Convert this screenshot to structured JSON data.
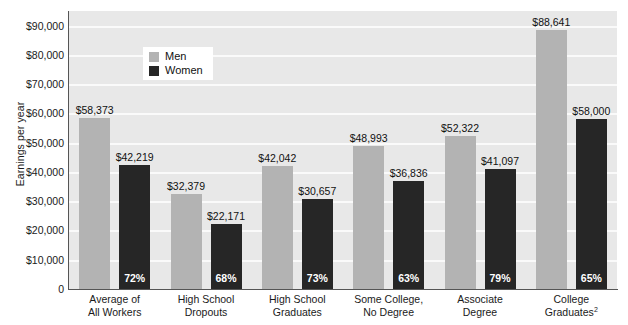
{
  "chart_data": {
    "type": "bar",
    "title": "",
    "xlabel": "",
    "ylabel": "Earnings per year",
    "ylim": [
      0,
      95000
    ],
    "grid": true,
    "legend_position": "top-left-inside",
    "categories": [
      "Average of All Workers",
      "High School Dropouts",
      "High School Graduates",
      "Some College, No Degree",
      "Associate Degree",
      "College Graduates"
    ],
    "category_lines": [
      [
        "Average of",
        "All Workers"
      ],
      [
        "High School",
        "Dropouts"
      ],
      [
        "High School",
        "Graduates"
      ],
      [
        "Some College,",
        "No Degree"
      ],
      [
        "Associate",
        "Degree"
      ],
      [
        "College",
        "Graduates"
      ]
    ],
    "category_footnotes": [
      "",
      "",
      "",
      "",
      "",
      "2"
    ],
    "series": [
      {
        "name": "Men",
        "color": "#b3b3b3",
        "values": [
          58373,
          32379,
          42042,
          48993,
          52322,
          88641
        ],
        "labels": [
          "$58,373",
          "$32,379",
          "$42,042",
          "$48,993",
          "$52,322",
          "$88,641"
        ]
      },
      {
        "name": "Women",
        "color": "#262626",
        "values": [
          42219,
          22171,
          30657,
          36836,
          41097,
          58000
        ],
        "labels": [
          "$42,219",
          "$22,171",
          "$30,657",
          "$36,836",
          "$41,097",
          "$58,000"
        ],
        "ratio_labels": [
          "72%",
          "68%",
          "73%",
          "63%",
          "79%",
          "65%"
        ]
      }
    ],
    "y_ticks": [
      0,
      10000,
      20000,
      30000,
      40000,
      50000,
      60000,
      70000,
      80000,
      90000
    ],
    "y_tick_labels": [
      "0",
      "$10,000",
      "$20,000",
      "$30,000",
      "$40,000",
      "$50,000",
      "$60,000",
      "$70,000",
      "$80,000",
      "$90,000"
    ]
  },
  "legend": {
    "items": [
      {
        "label": "Men",
        "color": "#b3b3b3"
      },
      {
        "label": "Women",
        "color": "#262626"
      }
    ]
  },
  "colors": {
    "plot_background": "#e8e8e8",
    "gridline": "#fafafa",
    "axis": "#555555",
    "men_bar": "#b3b3b3",
    "women_bar": "#262626",
    "text": "#1a1a1a",
    "pct_text": "#ffffff"
  }
}
